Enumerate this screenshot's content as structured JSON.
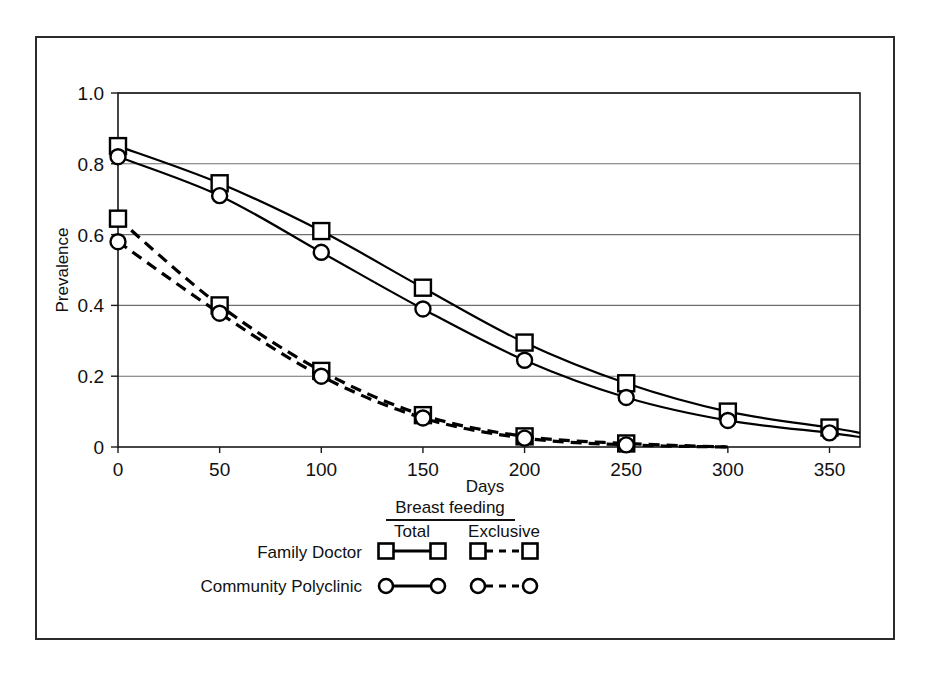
{
  "chart_data": {
    "type": "line",
    "title": "",
    "xlabel": "Days",
    "ylabel": "Prevalence",
    "xlim": [
      0,
      365
    ],
    "ylim": [
      0,
      1.0
    ],
    "grid": "horizontal",
    "xticks": [
      0,
      50,
      100,
      150,
      200,
      250,
      300,
      350
    ],
    "xtick_labels": [
      "0",
      "50",
      "100",
      "150",
      "200",
      "250",
      "300",
      "350"
    ],
    "yticks": [
      0,
      0.2,
      0.4,
      0.6,
      0.8,
      1.0
    ],
    "ytick_labels": [
      "0",
      "0.2",
      "0.4",
      "0.6",
      "0.8",
      "1.0"
    ],
    "legend_position": "below-plot",
    "legend_header": "Breast feeding",
    "legend_columns": [
      "Total",
      "Exclusive"
    ],
    "legend_rows": [
      "Family Doctor",
      "Community Polyclinic"
    ],
    "series": [
      {
        "name": "Family Doctor - Total",
        "group": "Family Doctor",
        "category": "Total",
        "marker": "square",
        "linestyle": "solid",
        "x": [
          0,
          50,
          100,
          150,
          200,
          250,
          300,
          350,
          365
        ],
        "values": [
          0.85,
          0.745,
          0.61,
          0.45,
          0.295,
          0.18,
          0.1,
          0.055,
          0.04
        ]
      },
      {
        "name": "Community Polyclinic - Total",
        "group": "Community Polyclinic",
        "category": "Total",
        "marker": "circle",
        "linestyle": "solid",
        "x": [
          0,
          50,
          100,
          150,
          200,
          250,
          300,
          350,
          365
        ],
        "values": [
          0.82,
          0.71,
          0.55,
          0.39,
          0.245,
          0.14,
          0.075,
          0.04,
          0.028
        ]
      },
      {
        "name": "Family Doctor - Exclusive",
        "group": "Family Doctor",
        "category": "Exclusive",
        "marker": "square",
        "linestyle": "dashed",
        "x": [
          0,
          50,
          100,
          150,
          200,
          250,
          300
        ],
        "values": [
          0.645,
          0.4,
          0.215,
          0.09,
          0.03,
          0.01,
          0.0
        ]
      },
      {
        "name": "Community Polyclinic - Exclusive",
        "group": "Community Polyclinic",
        "category": "Exclusive",
        "marker": "circle",
        "linestyle": "dashed",
        "x": [
          0,
          50,
          100,
          150,
          200,
          250,
          300
        ],
        "values": [
          0.58,
          0.378,
          0.2,
          0.082,
          0.025,
          0.006,
          0.0
        ]
      }
    ]
  },
  "axis": {
    "x_title": "Days",
    "y_title": "Prevalence",
    "x_labels": [
      "0",
      "50",
      "100",
      "150",
      "200",
      "250",
      "300",
      "350"
    ],
    "y_labels": [
      "1.0",
      "0.8",
      "0.6",
      "0.4",
      "0.2",
      "0"
    ]
  },
  "legend": {
    "header": "Breast feeding",
    "col_total": "Total",
    "col_exclusive": "Exclusive",
    "row_family_doctor": "Family Doctor",
    "row_community_polyclinic": "Community Polyclinic"
  }
}
